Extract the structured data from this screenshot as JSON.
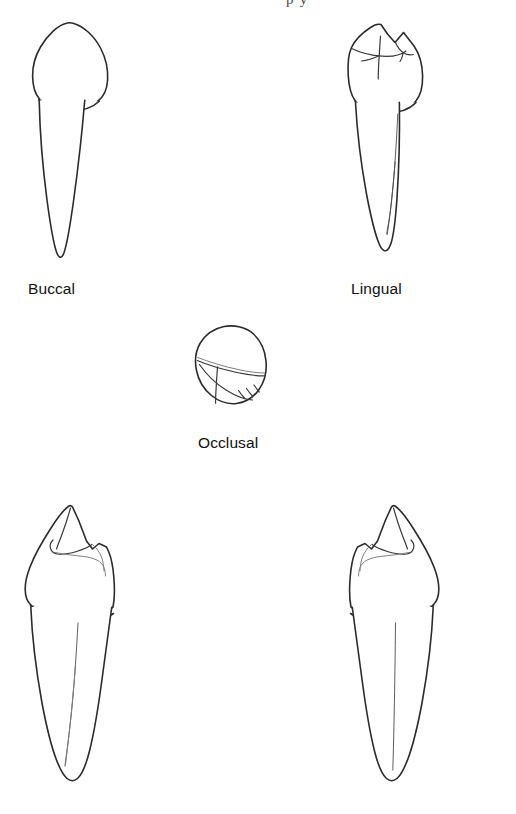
{
  "figure": {
    "title_fragment": "p     y",
    "background_color": "#ffffff",
    "line_color": "#2b2b2b",
    "detail_color": "#7e7e7e",
    "views": [
      {
        "id": "buccal",
        "label": "Buccal",
        "description": "Crown with rounded pentagonal outline and single tapering root"
      },
      {
        "id": "lingual",
        "label": "Lingual",
        "description": "Crown showing buccal cusp, small lingual cusp and marginal grooves; root with developmental groove"
      },
      {
        "id": "occlusal",
        "label": "Occlusal",
        "description": "Rounded diamond outline with transverse ridge and fissures"
      },
      {
        "id": "proximal-left",
        "label": "",
        "description": "Proximal view, tall buccal cusp left, small lingual cusp right, root with groove"
      },
      {
        "id": "proximal-right",
        "label": "",
        "description": "Proximal view mirrored, tall buccal cusp right, small lingual cusp left, root with groove"
      }
    ]
  }
}
